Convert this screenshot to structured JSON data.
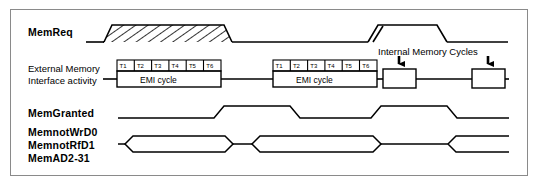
{
  "figure": {
    "kind": "timing-diagram",
    "background": "#ffffff",
    "border_color": "#8a8a8a",
    "line_color": "#000000"
  },
  "signals": {
    "memreq_label": "MemReq",
    "external_line1": "External  Memory",
    "external_line2": "Interface  activity",
    "memgranted_label": "MemGranted",
    "memnotwrd0_label": "MemnotWrD0",
    "memnotrfd1_label": "MemnotRfD1",
    "memad_label": "MemAD2-31"
  },
  "annotations": {
    "internal_memory_cycles": "Internal  Memory  Cycles"
  },
  "emi_cycles": [
    {
      "name": "emi-cycle-1",
      "caption": "EMI  cycle",
      "ticks": [
        "T1",
        "T2",
        "T3",
        "T4",
        "T5",
        "T6"
      ]
    },
    {
      "name": "emi-cycle-2",
      "caption": "EMI  cycle",
      "ticks": [
        "T1",
        "T2",
        "T3",
        "T4",
        "T5",
        "T6"
      ]
    }
  ]
}
